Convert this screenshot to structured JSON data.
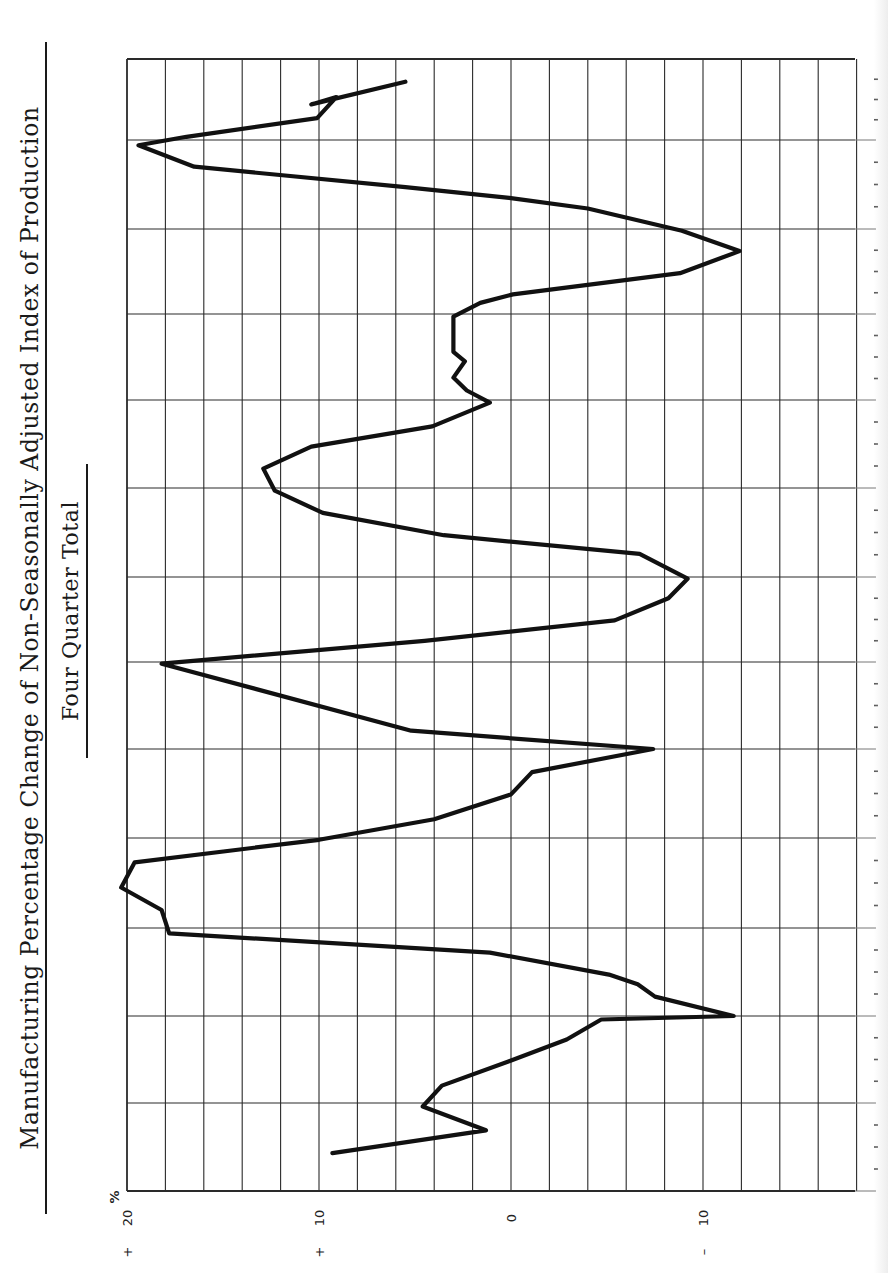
{
  "header": {
    "title": "Manufacturing Percentage Change of Non-Seasonally Adjusted Index of Production",
    "subtitle": "Four Quarter Total"
  },
  "axis": {
    "unit_symbol": "%",
    "tick_labels": [
      {
        "value": 20,
        "sign": "+",
        "text": "20"
      },
      {
        "value": 10,
        "sign": "+",
        "text": "10"
      },
      {
        "value": 0,
        "sign": "",
        "text": "0"
      },
      {
        "value": -10,
        "sign": "–",
        "text": "10"
      }
    ]
  },
  "colors": {
    "line": "#111111",
    "grid": "#2a2a2a",
    "background": "#ffffff"
  },
  "chart_data": {
    "type": "line",
    "title": "Manufacturing Percentage Change of Non-Seasonally Adjusted Index of Production",
    "subtitle": "Four Quarter Total",
    "orientation": "rotated 90deg counter-clockwise (time runs bottom-to-top on page, value axis along bottom edge)",
    "xlabel": "Time (quarters; 12 yearly grid intervals, quarterly tick marks)",
    "ylabel": "% change",
    "ylim": [
      -18,
      20
    ],
    "yticks": [
      20,
      10,
      0,
      -10
    ],
    "grid": true,
    "grid_vertical_step_pct": 2,
    "time_intervals": 13,
    "series": [
      {
        "name": "Manufacturing % change (4-quarter total)",
        "points": [
          {
            "t": 0.43,
            "v": 9.3
          },
          {
            "t": 0.69,
            "v": 1.3
          },
          {
            "t": 0.96,
            "v": 4.6
          },
          {
            "t": 1.2,
            "v": 3.6
          },
          {
            "t": 1.48,
            "v": 0.1
          },
          {
            "t": 1.73,
            "v": -2.9
          },
          {
            "t": 1.96,
            "v": -4.7
          },
          {
            "t": 2.0,
            "v": -11.6
          },
          {
            "t": 2.22,
            "v": -7.5
          },
          {
            "t": 2.36,
            "v": -6.6
          },
          {
            "t": 2.47,
            "v": -5.1
          },
          {
            "t": 2.72,
            "v": 1.1
          },
          {
            "t": 2.94,
            "v": 17.8
          },
          {
            "t": 3.2,
            "v": 18.2
          },
          {
            "t": 3.45,
            "v": 20.3
          },
          {
            "t": 3.73,
            "v": 19.6
          },
          {
            "t": 3.98,
            "v": 10.0
          },
          {
            "t": 4.21,
            "v": 4.0
          },
          {
            "t": 4.49,
            "v": 0.0
          },
          {
            "t": 4.74,
            "v": -1.1
          },
          {
            "t": 5.0,
            "v": -7.4
          },
          {
            "t": 5.21,
            "v": 5.2
          },
          {
            "t": 5.98,
            "v": 18.2
          },
          {
            "t": 6.25,
            "v": 4.5
          },
          {
            "t": 6.49,
            "v": -5.4
          },
          {
            "t": 6.75,
            "v": -8.2
          },
          {
            "t": 6.98,
            "v": -9.2
          },
          {
            "t": 7.26,
            "v": -6.7
          },
          {
            "t": 7.47,
            "v": 3.5
          },
          {
            "t": 7.72,
            "v": 9.8
          },
          {
            "t": 7.97,
            "v": 12.3
          },
          {
            "t": 8.22,
            "v": 12.9
          },
          {
            "t": 8.47,
            "v": 10.4
          },
          {
            "t": 8.7,
            "v": 4.1
          },
          {
            "t": 8.97,
            "v": 1.1
          },
          {
            "t": 9.11,
            "v": 2.3
          },
          {
            "t": 9.26,
            "v": 3.0
          },
          {
            "t": 9.45,
            "v": 2.4
          },
          {
            "t": 9.56,
            "v": 3.0
          },
          {
            "t": 9.97,
            "v": 3.0
          },
          {
            "t": 10.13,
            "v": 1.6
          },
          {
            "t": 10.23,
            "v": -0.1
          },
          {
            "t": 10.48,
            "v": -8.8
          },
          {
            "t": 10.74,
            "v": -11.9
          },
          {
            "t": 10.98,
            "v": -8.9
          },
          {
            "t": 11.23,
            "v": -4.0
          },
          {
            "t": 11.35,
            "v": 0.1
          },
          {
            "t": 11.47,
            "v": 5.5
          },
          {
            "t": 11.7,
            "v": 16.5
          },
          {
            "t": 11.94,
            "v": 19.4
          },
          {
            "t": 12.04,
            "v": 16.9
          },
          {
            "t": 12.27,
            "v": 10.1
          },
          {
            "t": 12.53,
            "v": 9.1
          },
          {
            "t": 12.44,
            "v": 10.4
          },
          {
            "t": 12.72,
            "v": 5.5
          }
        ]
      }
    ]
  }
}
